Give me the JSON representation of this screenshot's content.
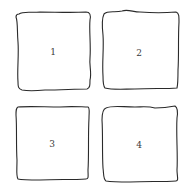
{
  "diagram": {
    "type": "hand-drawn grid of numbered boxes",
    "stroke_color": "#2a2a2a",
    "label_color": "#3a3a3a",
    "boxes": [
      {
        "label": "1",
        "position": "top-left"
      },
      {
        "label": "2",
        "position": "top-right"
      },
      {
        "label": "3",
        "position": "bottom-left"
      },
      {
        "label": "4",
        "position": "bottom-right"
      }
    ]
  }
}
